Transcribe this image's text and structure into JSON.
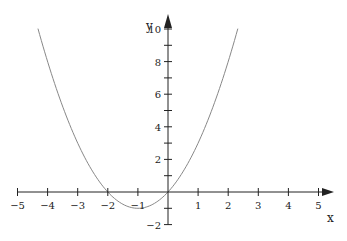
{
  "chart_data": {
    "type": "line",
    "title": "",
    "xlabel": "x",
    "ylabel": "y",
    "function": "y = x^2 + 2x",
    "xlim": [
      -5,
      5
    ],
    "ylim": [
      -2,
      10
    ],
    "x_ticks": [
      -5,
      -4,
      -3,
      -2,
      -1,
      1,
      2,
      3,
      4,
      5
    ],
    "x_tick_labels": [
      "−5",
      "−4",
      "−3",
      "−2",
      "−1",
      "1",
      "2",
      "3",
      "4",
      "5"
    ],
    "y_ticks": [
      -2,
      -1,
      1,
      2,
      3,
      4,
      5,
      6,
      7,
      8,
      9,
      10
    ],
    "y_labeled_ticks": [
      -2,
      2,
      4,
      6,
      8,
      10
    ],
    "y_tick_labels": [
      "−2",
      "2",
      "4",
      "6",
      "8",
      "10"
    ],
    "grid": false,
    "series": [
      {
        "name": "y = x^2 + 2x",
        "color": "#888888",
        "x_range": [
          -4.32,
          2.32
        ]
      }
    ],
    "axis_color": "#222222"
  }
}
